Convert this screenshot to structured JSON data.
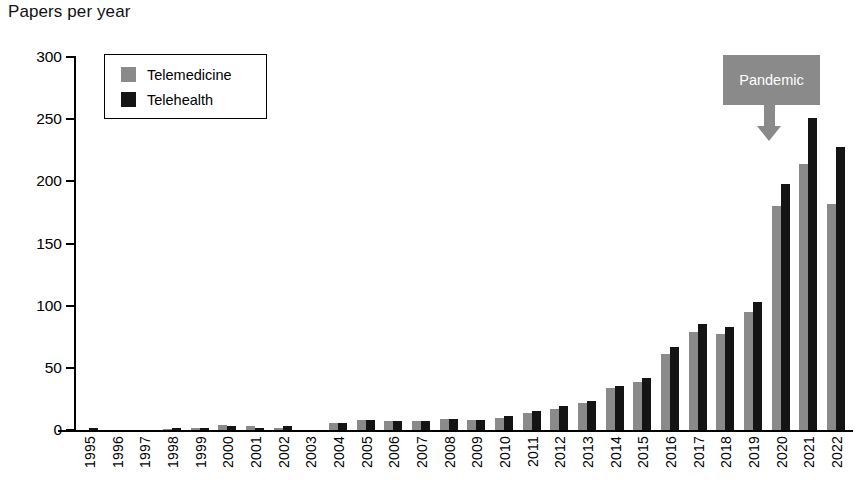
{
  "chart_data": {
    "type": "bar",
    "title": "Papers per year",
    "xlabel": "",
    "ylabel": "",
    "ylim": [
      0,
      300
    ],
    "yticks": [
      0,
      50,
      100,
      150,
      200,
      250,
      300
    ],
    "grid": false,
    "legend_position": "top-left",
    "categories": [
      "1995",
      "1996",
      "1997",
      "1998",
      "1999",
      "2000",
      "2001",
      "2002",
      "2003",
      "2004",
      "2005",
      "2006",
      "2007",
      "2008",
      "2009",
      "2010",
      "2011",
      "2012",
      "2013",
      "2014",
      "2015",
      "2016",
      "2017",
      "2018",
      "2019",
      "2020",
      "2021",
      "2022"
    ],
    "series": [
      {
        "name": "Telemedicine",
        "color": "#8a8a8a",
        "values": [
          0,
          0,
          0,
          1,
          2,
          4,
          3,
          2,
          0,
          6,
          8,
          7,
          7,
          9,
          8,
          10,
          14,
          17,
          22,
          34,
          39,
          61,
          79,
          77,
          95,
          180,
          214,
          182
        ]
      },
      {
        "name": "Telehealth",
        "color": "#141414",
        "values": [
          2,
          0,
          0,
          2,
          2,
          3,
          2,
          3,
          0,
          6,
          8,
          7,
          7,
          9,
          8,
          11,
          15,
          19,
          23,
          35,
          42,
          67,
          85,
          83,
          103,
          198,
          251,
          228
        ]
      }
    ],
    "annotations": [
      {
        "label": "Pandemic",
        "target_category": "2020",
        "box_color": "#8a8a8a",
        "text_color": "#ffffff"
      }
    ]
  },
  "legend": {
    "items": [
      {
        "label": "Telemedicine",
        "swatch": "med"
      },
      {
        "label": "Telehealth",
        "swatch": "health"
      }
    ]
  }
}
